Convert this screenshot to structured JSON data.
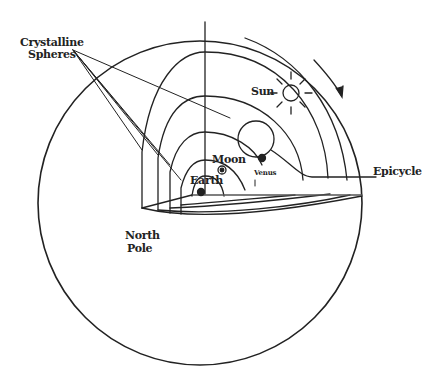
{
  "diagram": {
    "type": "cutaway celestial sphere diagram",
    "colors": {
      "ink": "#222222",
      "background": "#ffffff"
    },
    "labels": {
      "crystalline_spheres_line1": "Crystalline",
      "crystalline_spheres_line2": "Spheres",
      "sun": "Sun",
      "moon": "Moon",
      "earth": "Earth",
      "venus": "Venus",
      "epicycle": "Epicycle",
      "north_pole_line1": "North",
      "north_pole_line2": "Pole"
    },
    "elements": [
      {
        "name": "outer-celestial-sphere",
        "shape": "circle"
      },
      {
        "name": "crystalline-sphere",
        "count": 5,
        "shape": "nested quarter shells"
      },
      {
        "name": "sun",
        "shape": "circle with rays"
      },
      {
        "name": "epicycle",
        "shape": "circle carrying Venus"
      },
      {
        "name": "moon",
        "shape": "small ringed dot"
      },
      {
        "name": "venus",
        "shape": "small dark dot"
      },
      {
        "name": "earth",
        "shape": "small dark dot at center"
      },
      {
        "name": "rotation-arrow",
        "shape": "clockwise arrow",
        "direction": "clockwise"
      }
    ]
  }
}
